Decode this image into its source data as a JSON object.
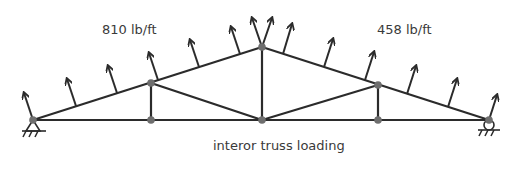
{
  "diagram": {
    "caption": "interor truss loading",
    "loads": {
      "left": {
        "label": "810 lb/ft",
        "count": 8
      },
      "right": {
        "label": "458 lb/ft",
        "count": 8
      }
    },
    "colors": {
      "member": "#2b2b2b",
      "joint": "#6e6e6e",
      "text": "#3a3a3a"
    },
    "joints": [
      {
        "id": "A",
        "x": 33,
        "y": 120,
        "support": "pin"
      },
      {
        "id": "B",
        "x": 151,
        "y": 83
      },
      {
        "id": "C",
        "x": 262,
        "y": 47
      },
      {
        "id": "D",
        "x": 378,
        "y": 85
      },
      {
        "id": "E",
        "x": 489,
        "y": 120,
        "support": "roller"
      },
      {
        "id": "F",
        "x": 151,
        "y": 120
      },
      {
        "id": "G",
        "x": 262,
        "y": 120
      },
      {
        "id": "H",
        "x": 378,
        "y": 120
      }
    ],
    "members": [
      [
        "A",
        "B"
      ],
      [
        "B",
        "C"
      ],
      [
        "C",
        "D"
      ],
      [
        "D",
        "E"
      ],
      [
        "A",
        "F"
      ],
      [
        "F",
        "G"
      ],
      [
        "G",
        "H"
      ],
      [
        "H",
        "E"
      ],
      [
        "B",
        "F"
      ],
      [
        "C",
        "G"
      ],
      [
        "D",
        "H"
      ],
      [
        "B",
        "G"
      ],
      [
        "D",
        "G"
      ]
    ]
  }
}
